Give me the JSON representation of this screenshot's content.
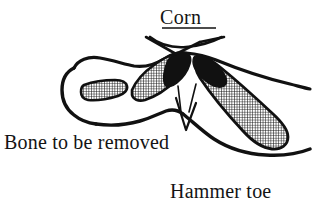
{
  "figure": {
    "type": "medical-line-drawing",
    "background_color": "#ffffff",
    "ink_color": "#111111",
    "labels": {
      "corn": "Corn",
      "bone_to_be_removed": "Bone to be  removed",
      "hammer_toe": "Hammer toe"
    },
    "annotations": {
      "corn_marker": "crossed-lines-x-marker",
      "corn_underline": "underline-rule",
      "bone_leader": "v-shaped-leader-line"
    },
    "anatomy": {
      "distal_phalanx": "small-hatched-bone",
      "middle_phalanx": "hatched-bone-with-black-wedge",
      "proximal_phalanx": "large-hatched-bone",
      "skin_outline": "toe-contour",
      "resection_wedge": "v-notch"
    },
    "fill_patterns": {
      "bone": "crosshatch",
      "joint": "solid-black"
    }
  }
}
